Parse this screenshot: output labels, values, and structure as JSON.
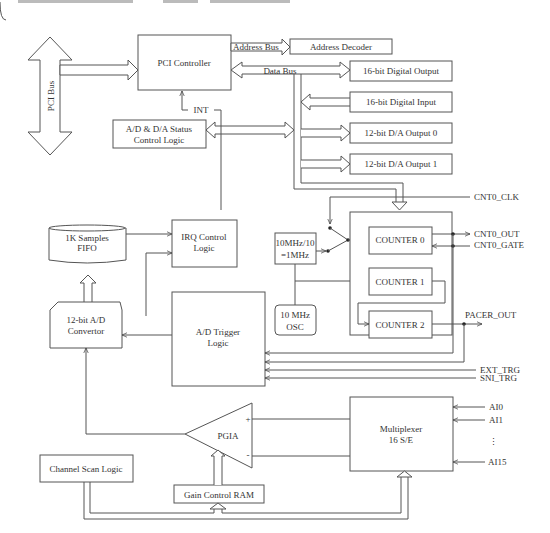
{
  "diagram": {
    "title": "",
    "blocks": {
      "pci_bus": "PCI Bus",
      "pci_controller": "PCI Controller",
      "address_bus": "Address Bus",
      "address_decoder": "Address Decoder",
      "data_bus": "Data Bus",
      "digital_output": "16-bit Digital Output",
      "digital_input": "16-bit Digital Input",
      "da_output_0": "12-bit D/A Output 0",
      "da_output_1": "12-bit D/A Output 1",
      "int": "INT",
      "status_control_1": "A/D & D/A Status",
      "status_control_2": "Control Logic",
      "fifo_1": "1K Samples",
      "fifo_2": "FIFO",
      "irq_1": "IRQ Control",
      "irq_2": "Logic",
      "divider_1": "10MHz/10",
      "divider_2": "=1MHz",
      "osc_1": "10 MHz",
      "osc_2": "OSC",
      "counter0": "COUNTER 0",
      "counter1": "COUNTER 1",
      "counter2": "COUNTER 2",
      "adc_1": "12-bit A/D",
      "adc_2": "Convertor",
      "trigger_1": "A/D Trigger",
      "trigger_2": "Logic",
      "pgia": "PGIA",
      "pgia_plus": "+",
      "pgia_minus": "-",
      "mux_1": "Multiplexer",
      "mux_2": "16 S/E",
      "channel_scan": "Channel Scan Logic",
      "gain_ram": "Gain Control RAM"
    },
    "signals": {
      "cnt0_clk": "CNT0_CLK",
      "cnt0_out": "CNT0_OUT",
      "cnt0_gate": "CNT0_GATE",
      "pacer_out": "PACER_OUT",
      "ext_trg": "EXT_TRG",
      "sni_trg": "SNI_TRG",
      "ai0": "AI0",
      "ai1": "AI1",
      "ellipsis": "⋮",
      "ai15": "AI15"
    }
  }
}
